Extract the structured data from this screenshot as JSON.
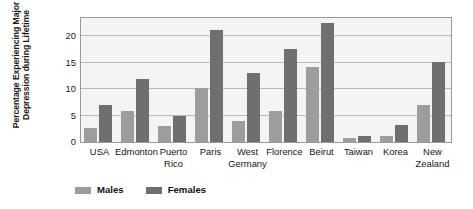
{
  "chart_data": {
    "type": "bar",
    "title": "",
    "xlabel": "",
    "ylabel": "Percentage Experiencing Major Depression during Lifetime",
    "ylabel_line1": "Percentage Experiencing Major",
    "ylabel_line2": "Depression during Lifetime",
    "ylim": [
      0,
      23.5
    ],
    "yticks": [
      0,
      5,
      10,
      15,
      20
    ],
    "ytick_labels": [
      "0",
      "5",
      "10",
      "15",
      "20"
    ],
    "grid": true,
    "grid_axis": "y",
    "legend_position": "bottom-left",
    "categories": [
      "USA",
      "Edmonton",
      "Puerto Rico",
      "Paris",
      "West Germany",
      "Florence",
      "Beirut",
      "Taiwan",
      "Korea",
      "New Zealand"
    ],
    "category_lines": [
      [
        "USA",
        ""
      ],
      [
        "Edmonton",
        ""
      ],
      [
        "Puerto",
        "Rico"
      ],
      [
        "Paris",
        ""
      ],
      [
        "West",
        "Germany"
      ],
      [
        "Florence",
        ""
      ],
      [
        "Beirut",
        ""
      ],
      [
        "Taiwan",
        ""
      ],
      [
        "Korea",
        ""
      ],
      [
        "New",
        "Zealand"
      ]
    ],
    "series": [
      {
        "name": "Males",
        "color": "#9d9d9d",
        "values": [
          2.6,
          5.9,
          3.1,
          10.2,
          4.0,
          5.8,
          14.2,
          0.8,
          1.2,
          7.0
        ]
      },
      {
        "name": "Females",
        "color": "#6f6f6f",
        "values": [
          7.0,
          11.9,
          5.0,
          21.2,
          13.0,
          17.6,
          22.5,
          1.2,
          3.2,
          15.2
        ]
      }
    ]
  },
  "legend": {
    "items": [
      {
        "label": "Males",
        "color": "#9d9d9d"
      },
      {
        "label": "Females",
        "color": "#6f6f6f"
      }
    ]
  },
  "colors": {
    "plot_background": "#f4f4f2",
    "plot_border": "#9a9a9a",
    "gridline": "#b9b9b7",
    "males_bar": "#9d9d9d",
    "females_bar": "#6f6f6f",
    "text": "#151515"
  }
}
